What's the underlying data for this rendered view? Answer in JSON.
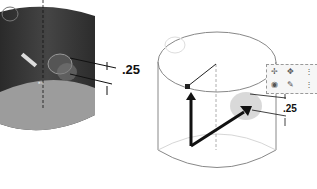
{
  "figures": {
    "left": {
      "description": "shaded dark cylinder with hole feature and dimension",
      "dimension_label": ".25",
      "colors": {
        "body": "#3a3a3a",
        "bottom": "#9a9a9a",
        "edge": "#222222"
      }
    },
    "right": {
      "description": "transparent cylinder with hole wizard point and direction arrows",
      "dimension_label": ".25",
      "colors": {
        "outline": "#888888",
        "arrow": "#111111",
        "bubble": "#c8c8c8"
      }
    }
  },
  "toolbar": {
    "icons": [
      "point-icon",
      "pin-icon",
      "more-icon",
      "sketch-icon",
      "tool-icon",
      "more-icon-2"
    ],
    "glyphs": [
      "✢",
      "✥",
      "⋮",
      "◉",
      "✎",
      "⋮"
    ]
  }
}
